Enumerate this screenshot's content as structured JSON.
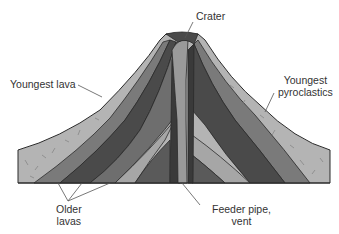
{
  "diagram": {
    "labels": {
      "crater": "Crater",
      "youngest_lava": "Youngest lava",
      "youngest_pyroclastics_line1": "Youngest",
      "youngest_pyroclastics_line2": "pyroclastics",
      "older_lavas_line1": "Older",
      "older_lavas_line2": "lavas",
      "feeder_pipe_line1": "Feeder pipe,",
      "feeder_pipe_line2": "vent"
    },
    "colors": {
      "pyroclastics": "#b4b4b4",
      "lava_dark": "#4a4a4a",
      "lava_mid": "#6e6e6e",
      "lava_light": "#8c8c8c",
      "pyro_inner": "#a6a6a6",
      "vent": "#9a9a9a",
      "outline": "#2a2a2a",
      "leader": "#555555"
    }
  }
}
